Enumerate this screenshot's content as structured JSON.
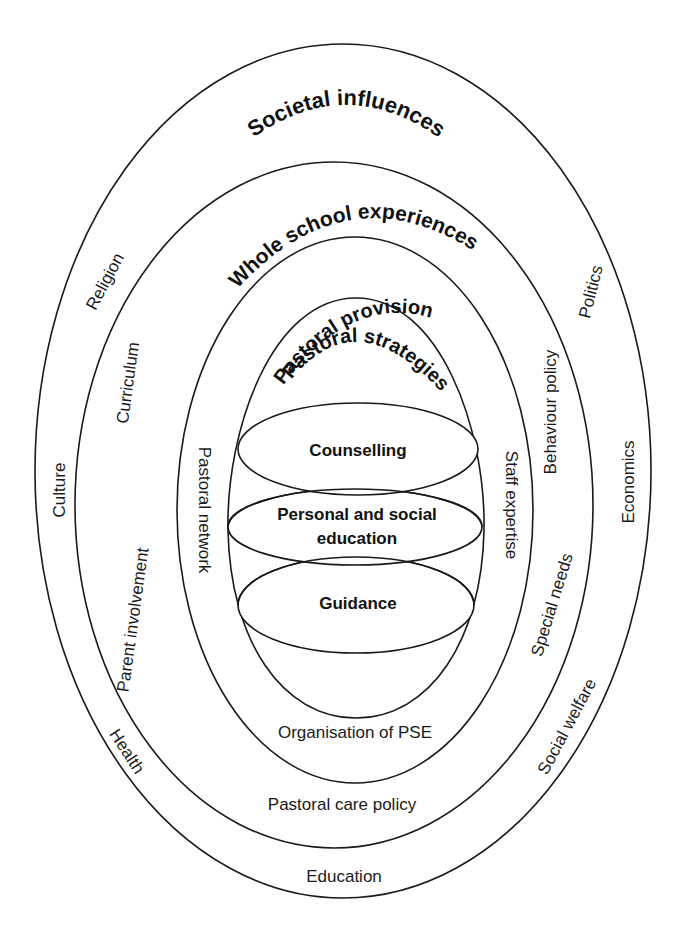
{
  "diagram": {
    "layers": [
      {
        "id": "societal",
        "heading": "Societal influences"
      },
      {
        "id": "whole-school",
        "heading": "Whole school experiences"
      },
      {
        "id": "provision",
        "heading": "Pastoral provision"
      },
      {
        "id": "strategies",
        "heading": "Pastoral strategies"
      }
    ],
    "societal_labels": {
      "religion": "Religion",
      "politics": "Politics",
      "culture": "Culture",
      "economics": "Economics",
      "health": "Health",
      "social_welfare": "Social welfare",
      "education": "Education"
    },
    "whole_school_labels": {
      "curriculum": "Curriculum",
      "behaviour_policy": "Behaviour policy",
      "parent_involvement": "Parent involvement",
      "special_needs": "Special needs",
      "pastoral_care_policy": "Pastoral care policy"
    },
    "provision_labels": {
      "pastoral_network": "Pastoral network",
      "staff_expertise": "Staff expertise",
      "organisation_pse": "Organisation of PSE"
    },
    "strategies": {
      "counselling": "Counselling",
      "pse_line1": "Personal and social",
      "pse_line2": "education",
      "guidance": "Guidance"
    }
  }
}
